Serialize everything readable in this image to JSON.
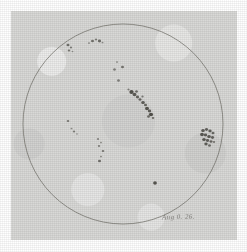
{
  "plate": {
    "title": "Solar disk sunspot drawing",
    "medium": "pencil on aged paper",
    "paper_color": "#d9d9d7",
    "ink_color": "#4a4843",
    "border_color": "#ffffff"
  },
  "caption": {
    "date_text": "Aug 0. 26."
  },
  "disk": {
    "label": "solar-disk-outline",
    "center_x": 123,
    "center_y": 124,
    "radius": 100,
    "stroke_color": "#6b6962",
    "stroke_width": 0.8
  },
  "chart_data": {
    "type": "scatter",
    "xlabel": "",
    "ylabel": "",
    "xlim": [
      23,
      223
    ],
    "ylim": [
      24,
      224
    ],
    "grid": false,
    "legend": "none",
    "annotations": [
      "Aug 0. 26."
    ],
    "disk_center": [
      123,
      124
    ],
    "disk_radius": 100,
    "groups": [
      {
        "name": "group-nw-limb",
        "region": "north-west limb",
        "cx": 70,
        "cy": 48,
        "spots": [
          {
            "x": 68.0,
            "y": 45.0,
            "r": 1.5,
            "darkness": 0.72
          },
          {
            "x": 71.0,
            "y": 47.5,
            "r": 1.1,
            "darkness": 0.62
          },
          {
            "x": 69.0,
            "y": 50.5,
            "r": 1.3,
            "darkness": 0.66
          },
          {
            "x": 72.5,
            "y": 51.5,
            "r": 0.9,
            "darkness": 0.5
          }
        ]
      },
      {
        "name": "group-north-upper",
        "region": "north, near upper limb",
        "cx": 95,
        "cy": 41,
        "spots": [
          {
            "x": 89.0,
            "y": 43.0,
            "r": 1.0,
            "darkness": 0.55
          },
          {
            "x": 92.5,
            "y": 41.0,
            "r": 1.5,
            "darkness": 0.7
          },
          {
            "x": 96.0,
            "y": 39.5,
            "r": 1.2,
            "darkness": 0.62
          },
          {
            "x": 99.5,
            "y": 41.0,
            "r": 1.6,
            "darkness": 0.74
          },
          {
            "x": 102.5,
            "y": 42.5,
            "r": 1.0,
            "darkness": 0.52
          }
        ]
      },
      {
        "name": "group-central-north",
        "region": "central north",
        "cx": 117,
        "cy": 68,
        "spots": [
          {
            "x": 117.0,
            "y": 62.0,
            "r": 1.0,
            "darkness": 0.55
          },
          {
            "x": 114.5,
            "y": 69.5,
            "r": 1.4,
            "darkness": 0.6
          },
          {
            "x": 122.5,
            "y": 67.0,
            "r": 1.5,
            "darkness": 0.68
          },
          {
            "x": 118.5,
            "y": 80.5,
            "r": 1.4,
            "darkness": 0.62
          }
        ]
      },
      {
        "name": "group-main-diagonal",
        "region": "central, large bipolar group",
        "cx": 142,
        "cy": 103,
        "spots": [
          {
            "x": 131.5,
            "y": 92.0,
            "r": 2.2,
            "darkness": 0.92
          },
          {
            "x": 134.5,
            "y": 94.5,
            "r": 1.9,
            "darkness": 0.86
          },
          {
            "x": 136.5,
            "y": 91.5,
            "r": 1.4,
            "darkness": 0.72
          },
          {
            "x": 137.5,
            "y": 97.0,
            "r": 1.6,
            "darkness": 0.8
          },
          {
            "x": 140.0,
            "y": 99.5,
            "r": 1.5,
            "darkness": 0.78
          },
          {
            "x": 142.5,
            "y": 96.5,
            "r": 1.2,
            "darkness": 0.64
          },
          {
            "x": 143.0,
            "y": 102.5,
            "r": 1.8,
            "darkness": 0.85
          },
          {
            "x": 145.5,
            "y": 105.0,
            "r": 1.5,
            "darkness": 0.76
          },
          {
            "x": 147.0,
            "y": 108.5,
            "r": 2.0,
            "darkness": 0.9
          },
          {
            "x": 149.5,
            "y": 111.0,
            "r": 1.7,
            "darkness": 0.83
          },
          {
            "x": 151.0,
            "y": 114.5,
            "r": 2.1,
            "darkness": 0.93
          },
          {
            "x": 148.5,
            "y": 116.5,
            "r": 1.4,
            "darkness": 0.74
          },
          {
            "x": 153.0,
            "y": 118.0,
            "r": 1.3,
            "darkness": 0.7
          },
          {
            "x": 128.5,
            "y": 89.5,
            "r": 1.1,
            "darkness": 0.6
          }
        ]
      },
      {
        "name": "group-east-limb-cluster",
        "region": "east limb, dense cluster",
        "cx": 209,
        "cy": 137,
        "spots": [
          {
            "x": 203.0,
            "y": 130.5,
            "r": 1.8,
            "darkness": 0.85
          },
          {
            "x": 206.5,
            "y": 129.5,
            "r": 1.6,
            "darkness": 0.8
          },
          {
            "x": 210.0,
            "y": 131.0,
            "r": 1.7,
            "darkness": 0.83
          },
          {
            "x": 213.0,
            "y": 133.0,
            "r": 1.5,
            "darkness": 0.76
          },
          {
            "x": 202.0,
            "y": 134.5,
            "r": 1.9,
            "darkness": 0.88
          },
          {
            "x": 205.5,
            "y": 135.0,
            "r": 1.7,
            "darkness": 0.84
          },
          {
            "x": 209.0,
            "y": 136.5,
            "r": 1.8,
            "darkness": 0.86
          },
          {
            "x": 212.5,
            "y": 137.5,
            "r": 1.6,
            "darkness": 0.79
          },
          {
            "x": 204.0,
            "y": 139.5,
            "r": 1.8,
            "darkness": 0.87
          },
          {
            "x": 207.5,
            "y": 140.5,
            "r": 1.6,
            "darkness": 0.82
          },
          {
            "x": 211.0,
            "y": 141.5,
            "r": 1.5,
            "darkness": 0.77
          },
          {
            "x": 206.0,
            "y": 144.0,
            "r": 1.7,
            "darkness": 0.83
          },
          {
            "x": 209.5,
            "y": 145.5,
            "r": 1.4,
            "darkness": 0.72
          },
          {
            "x": 214.0,
            "y": 142.0,
            "r": 1.2,
            "darkness": 0.66
          }
        ]
      },
      {
        "name": "group-west-small",
        "region": "west, small scattered pair",
        "cx": 70,
        "cy": 125,
        "spots": [
          {
            "x": 68.0,
            "y": 121.0,
            "r": 1.3,
            "darkness": 0.66
          },
          {
            "x": 71.5,
            "y": 128.5,
            "r": 1.0,
            "darkness": 0.55
          },
          {
            "x": 74.0,
            "y": 131.5,
            "r": 1.2,
            "darkness": 0.62
          },
          {
            "x": 77.0,
            "y": 134.0,
            "r": 0.9,
            "darkness": 0.48
          }
        ]
      },
      {
        "name": "group-south-central",
        "region": "south central, scattered chain",
        "cx": 100,
        "cy": 150,
        "spots": [
          {
            "x": 98.0,
            "y": 139.0,
            "r": 1.1,
            "darkness": 0.58
          },
          {
            "x": 101.0,
            "y": 142.5,
            "r": 1.0,
            "darkness": 0.52
          },
          {
            "x": 99.0,
            "y": 146.0,
            "r": 1.2,
            "darkness": 0.6
          },
          {
            "x": 103.0,
            "y": 151.0,
            "r": 1.3,
            "darkness": 0.66
          },
          {
            "x": 101.0,
            "y": 156.5,
            "r": 1.0,
            "darkness": 0.54
          },
          {
            "x": 99.5,
            "y": 161.0,
            "r": 1.5,
            "darkness": 0.72
          }
        ]
      },
      {
        "name": "spot-isolated-south",
        "region": "south, isolated single spot",
        "cx": 155,
        "cy": 183,
        "spots": [
          {
            "x": 155.0,
            "y": 183.0,
            "r": 1.9,
            "darkness": 0.9
          }
        ]
      }
    ]
  }
}
